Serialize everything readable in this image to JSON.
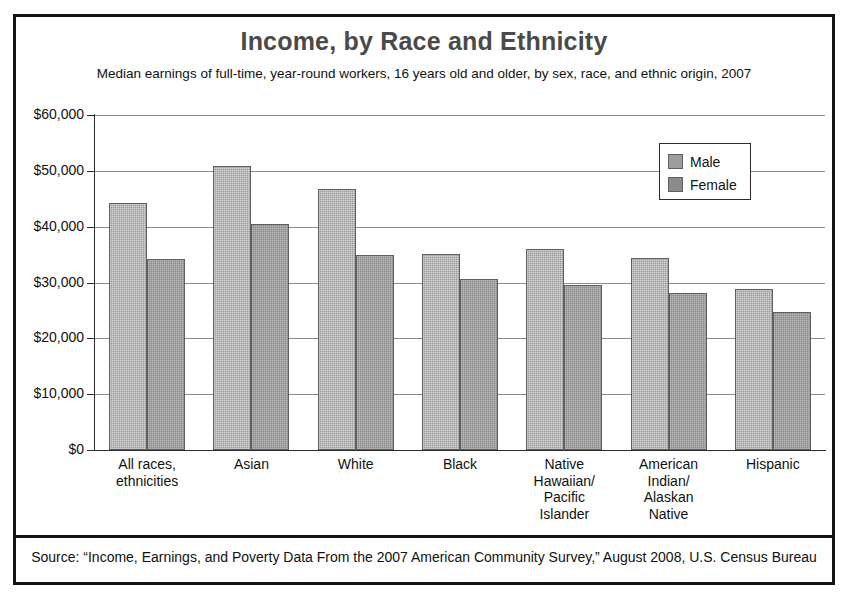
{
  "header": {
    "title": "Income, by Race and Ethnicity",
    "subtitle": "Median earnings of full-time, year-round workers, 16 years old and older, by sex, race, and ethnic origin, 2007"
  },
  "footer": {
    "source": "Source: “Income, Earnings, and Poverty Data From the 2007 American Community Survey,” August 2008, U.S. Census Bureau"
  },
  "legend": {
    "position": "top-right",
    "items": [
      {
        "label": "Male",
        "color": "#9d9d9d"
      },
      {
        "label": "Female",
        "color": "#8a8a8a"
      }
    ]
  },
  "axis": {
    "y_ticks": [
      "$60,000",
      "$50,000",
      "$40,000",
      "$30,000",
      "$20,000",
      "$10,000",
      "$0"
    ],
    "y_values": [
      60000,
      50000,
      40000,
      30000,
      20000,
      10000,
      0
    ]
  },
  "categories_display": [
    [
      "All races,",
      "ethnicities"
    ],
    [
      "Asian"
    ],
    [
      "White"
    ],
    [
      "Black"
    ],
    [
      "Native",
      "Hawaiian/",
      "Pacific",
      "Islander"
    ],
    [
      "American",
      "Indian/",
      "Alaskan",
      "Native"
    ],
    [
      "Hispanic"
    ]
  ],
  "chart_data": {
    "type": "bar",
    "title": "Income, by Race and Ethnicity",
    "subtitle": "Median earnings of full-time, year-round workers, 16 years old and older, by sex, race, and ethnic origin, 2007",
    "xlabel": "",
    "ylabel": "",
    "ylim": [
      0,
      60000
    ],
    "ytick_step": 10000,
    "grid": true,
    "legend_position": "top-right",
    "categories": [
      "All races, ethnicities",
      "Asian",
      "White",
      "Black",
      "Native Hawaiian/Pacific Islander",
      "American Indian/Alaskan Native",
      "Hispanic"
    ],
    "series": [
      {
        "name": "Male",
        "color": "#9d9d9d",
        "values": [
          44200,
          50900,
          46700,
          35100,
          36000,
          34400,
          28900
        ]
      },
      {
        "name": "Female",
        "color": "#8a8a8a",
        "values": [
          34300,
          40400,
          35000,
          30700,
          29500,
          28200,
          24700
        ]
      }
    ]
  }
}
